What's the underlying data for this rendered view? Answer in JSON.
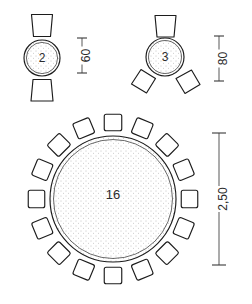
{
  "drawing": {
    "title": "Round table seating plans",
    "background_color": "#ffffff",
    "line_color": "#1c1c1c",
    "text_color": "#2b2b2b",
    "fill_color": "#ffffff",
    "stipple_color": "#7a7a7a"
  },
  "chart_data": {
    "type": "diagram",
    "subtype": "furniture-layout-plan",
    "units_note": "small tables in cm, large table in m",
    "tables": [
      {
        "id": "table-2",
        "seat_count_label": "2",
        "seats": 2,
        "table_shape": "circle",
        "chair_shape": "trapezoid",
        "chair_angles_deg": [
          0,
          180
        ],
        "center_px": [
          42,
          58
        ],
        "table_radius_px": 18,
        "dimension": {
          "label": "60",
          "value": 60,
          "orientation": "vertical",
          "text_rotation_deg": -90
        }
      },
      {
        "id": "table-3",
        "seat_count_label": "3",
        "seats": 3,
        "table_shape": "circle",
        "chair_shape": "square",
        "chair_angles_deg": [
          0,
          120,
          240
        ],
        "center_px": [
          165,
          57
        ],
        "table_radius_px": 19,
        "dimension": {
          "label": "80",
          "value": 80,
          "orientation": "vertical",
          "text_rotation_deg": -90
        }
      },
      {
        "id": "table-16",
        "seat_count_label": "16",
        "seats": 16,
        "table_shape": "circle",
        "chair_shape": "square",
        "center_px": [
          113,
          199
        ],
        "table_radius_px": 63,
        "dimension": {
          "label": "2,50",
          "value": 2.5,
          "orientation": "vertical",
          "text_rotation_deg": -90
        }
      }
    ],
    "dimensions": [
      {
        "label": "60",
        "x_px": 82,
        "y_top_px": 38,
        "y_bottom_px": 73,
        "tick_half_width_px": 5
      },
      {
        "label": "80",
        "x_px": 219,
        "y_top_px": 36,
        "y_bottom_px": 81,
        "tick_half_width_px": 5
      },
      {
        "label": "2,50",
        "x_px": 219,
        "y_top_px": 133,
        "y_bottom_px": 265,
        "tick_half_width_px": 7
      }
    ]
  }
}
